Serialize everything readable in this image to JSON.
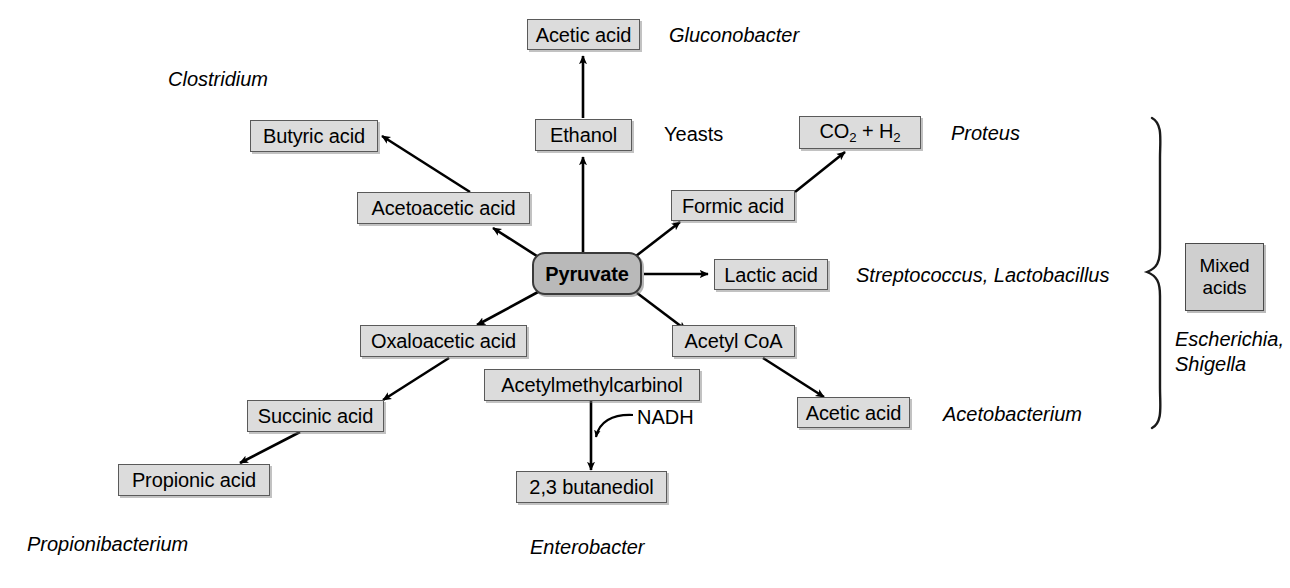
{
  "diagram": {
    "center": {
      "label": "Pyruvate"
    },
    "nodes": [
      {
        "id": "acetic-acid-top",
        "label": "Acetic acid"
      },
      {
        "id": "butyric-acid",
        "label": "Butyric acid"
      },
      {
        "id": "ethanol",
        "label": "Ethanol"
      },
      {
        "id": "co2-h2",
        "label": "CO2 + H2",
        "html": "CO<sub>2</sub> + H<sub>2</sub>"
      },
      {
        "id": "acetoacetic-acid",
        "label": "Acetoacetic acid"
      },
      {
        "id": "formic-acid",
        "label": "Formic acid"
      },
      {
        "id": "lactic-acid",
        "label": "Lactic acid"
      },
      {
        "id": "oxaloacetic-acid",
        "label": "Oxaloacetic acid"
      },
      {
        "id": "acetyl-coa",
        "label": "Acetyl CoA"
      },
      {
        "id": "acetylmethylcarbinol",
        "label": "Acetylmethylcarbinol"
      },
      {
        "id": "succinic-acid",
        "label": "Succinic acid"
      },
      {
        "id": "acetic-acid-right",
        "label": "Acetic acid"
      },
      {
        "id": "propionic-acid",
        "label": "Propionic acid"
      },
      {
        "id": "butanediol",
        "label": "2,3 butanediol"
      },
      {
        "id": "mixed-acids-line1",
        "label": "Mixed"
      },
      {
        "id": "mixed-acids-line2",
        "label": "acids"
      }
    ],
    "organisms": [
      {
        "id": "gluconobacter",
        "label": "Gluconobacter"
      },
      {
        "id": "clostridium",
        "label": "Clostridium"
      },
      {
        "id": "proteus",
        "label": "Proteus"
      },
      {
        "id": "streptococcus-lactobacillus",
        "label": "Streptococcus, Lactobacillus"
      },
      {
        "id": "acetobacterium",
        "label": "Acetobacterium"
      },
      {
        "id": "escherichia",
        "label": "Escherichia,"
      },
      {
        "id": "shigella",
        "label": "Shigella"
      },
      {
        "id": "propionibacterium",
        "label": "Propionibacterium"
      },
      {
        "id": "enterobacter",
        "label": "Enterobacter"
      }
    ],
    "plain_labels": [
      {
        "id": "yeasts",
        "label": "Yeasts"
      }
    ],
    "cofactors": [
      {
        "id": "nadh",
        "label": "NADH"
      }
    ],
    "edges": [
      {
        "from": "ethanol",
        "to": "acetic-acid-top"
      },
      {
        "from": "pyruvate",
        "to": "ethanol"
      },
      {
        "from": "acetoacetic-acid",
        "to": "butyric-acid"
      },
      {
        "from": "pyruvate",
        "to": "acetoacetic-acid"
      },
      {
        "from": "formic-acid",
        "to": "co2-h2"
      },
      {
        "from": "pyruvate",
        "to": "formic-acid"
      },
      {
        "from": "pyruvate",
        "to": "lactic-acid"
      },
      {
        "from": "pyruvate",
        "to": "acetyl-coa"
      },
      {
        "from": "pyruvate",
        "to": "oxaloacetic-acid"
      },
      {
        "from": "oxaloacetic-acid",
        "to": "succinic-acid"
      },
      {
        "from": "succinic-acid",
        "to": "propionic-acid"
      },
      {
        "from": "acetyl-coa",
        "to": "acetic-acid-right"
      },
      {
        "from": "acetylmethylcarbinol",
        "to": "butanediol"
      },
      {
        "from": "nadh",
        "to": "butanediol-arrow"
      }
    ],
    "colors": {
      "box_fill": "#dcdcdc",
      "box_border": "#5a5a5a",
      "center_fill": "#b9b9b9",
      "center_border": "#3a3a3a",
      "mixed_fill": "#cfcfcf",
      "line": "#000000",
      "background": "#ffffff"
    }
  }
}
